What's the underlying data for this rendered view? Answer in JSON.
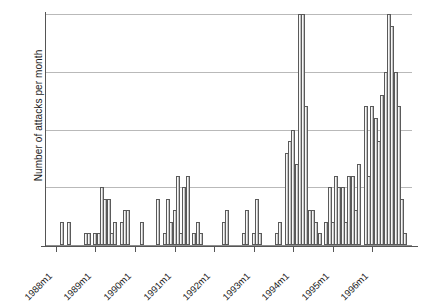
{
  "chart_data": {
    "type": "bar",
    "title": "",
    "subtitle": "",
    "xlabel": "",
    "ylabel": "Number of attacks per month",
    "ylim": [
      0,
      20
    ],
    "yticks": [
      0,
      5,
      10,
      15,
      20
    ],
    "ytick_labels": [
      "0",
      "5",
      "10",
      "15",
      "20"
    ],
    "xtick_labels": [
      "1988m1",
      "1989m1",
      "1990m1",
      "1991m1",
      "1992m1",
      "1993m1",
      "1994m1",
      "1995m1",
      "1996m1"
    ],
    "xtick_values": [
      1988.0,
      1989.0,
      1990.0,
      1991.0,
      1992.0,
      1993.0,
      1994.0,
      1995.0,
      1996.0
    ],
    "xlim": [
      1987.75,
      1997.0
    ],
    "grid": "horizontal",
    "legend": "none",
    "bar_color": "#d8d8d8",
    "bar_edge_color": "#5a5a5a",
    "grid_color": "#b9b9b9",
    "axis_color": "#555555",
    "x_unit": "month",
    "categories": [
      "1988m3",
      "1988m5",
      "1988m10",
      "1988m11",
      "1989m1",
      "1989m2",
      "1989m3",
      "1989m4",
      "1989m5",
      "1989m6",
      "1989m7",
      "1989m9",
      "1989m10",
      "1989m11",
      "1990m3",
      "1990m8",
      "1990m10",
      "1990m11",
      "1990m12",
      "1991m1",
      "1991m2",
      "1991m3",
      "1991m4",
      "1991m5",
      "1991m7",
      "1991m8",
      "1991m9",
      "1992m4",
      "1992m5",
      "1992m10",
      "1992m11",
      "1993m1",
      "1993m2",
      "1993m3",
      "1993m8",
      "1993m9",
      "1993m11",
      "1993m12",
      "1994m1",
      "1994m2",
      "1994m3",
      "1994m4",
      "1994m5",
      "1994m6",
      "1994m7",
      "1994m8",
      "1994m9",
      "1994m11",
      "1994m12",
      "1995m1",
      "1995m2",
      "1995m3",
      "1995m4",
      "1995m5",
      "1995m6",
      "1995m7",
      "1995m8",
      "1995m9",
      "1995m11",
      "1995m12",
      "1996m1",
      "1996m2",
      "1996m3",
      "1996m4",
      "1996m5",
      "1996m6",
      "1996m7",
      "1996m8",
      "1996m9",
      "1996m10",
      "1996m11"
    ],
    "values": [
      2,
      2,
      1,
      1,
      1,
      1,
      5,
      4,
      4,
      1,
      2,
      2,
      3,
      3,
      2,
      4,
      1,
      4,
      2,
      3,
      6,
      1,
      5,
      6,
      1,
      2,
      1,
      2,
      3,
      1,
      3,
      1,
      4,
      1,
      1,
      2,
      8,
      9,
      10,
      7,
      20,
      20,
      12,
      3,
      3,
      2,
      1,
      2,
      5,
      2,
      6,
      5,
      5,
      2,
      6,
      6,
      3,
      7,
      12,
      6,
      12,
      11,
      9,
      13,
      15,
      20,
      19,
      15,
      12,
      4,
      1
    ]
  }
}
